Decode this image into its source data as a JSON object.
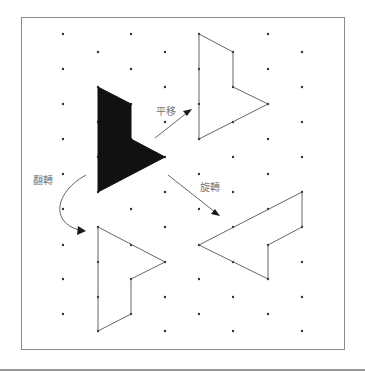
{
  "diagram": {
    "title": "",
    "frame": {
      "x": 21,
      "y": 17,
      "width": 323,
      "height": 332
    },
    "grid": {
      "columns_even_x": [
        63,
        131,
        199,
        268
      ],
      "columns_odd_x": [
        98,
        165,
        233,
        302
      ],
      "rows_even_y": [
        34,
        69,
        104,
        139,
        174,
        209,
        245,
        279,
        314
      ],
      "rows_odd_y": [
        52,
        87,
        122,
        157,
        192,
        227,
        262,
        297,
        331
      ]
    },
    "shapes": [
      {
        "name": "original-shape",
        "filled": true,
        "points": [
          [
            98,
            87
          ],
          [
            131,
            104
          ],
          [
            131,
            139
          ],
          [
            165,
            157
          ],
          [
            98,
            192
          ]
        ]
      },
      {
        "name": "translated-shape",
        "filled": false,
        "points": [
          [
            199,
            34
          ],
          [
            233,
            52
          ],
          [
            233,
            87
          ],
          [
            268,
            104
          ],
          [
            199,
            139
          ]
        ]
      },
      {
        "name": "flipped-shape",
        "filled": false,
        "points": [
          [
            98,
            227
          ],
          [
            165,
            262
          ],
          [
            131,
            279
          ],
          [
            131,
            314
          ],
          [
            98,
            331
          ]
        ]
      },
      {
        "name": "rotated-shape",
        "filled": false,
        "points": [
          [
            302,
            192
          ],
          [
            302,
            227
          ],
          [
            268,
            245
          ],
          [
            268,
            279
          ],
          [
            199,
            245
          ]
        ]
      }
    ],
    "arrows": [
      {
        "name": "translate-arrow",
        "path": "M155,138 L188,112",
        "head": [
          [
            192,
            109
          ],
          [
            183,
            111
          ],
          [
            187,
            116
          ]
        ]
      },
      {
        "name": "rotate-arrow",
        "path": "M168,175 L215,212",
        "head": [
          [
            220,
            216
          ],
          [
            211,
            214
          ],
          [
            215,
            209
          ]
        ]
      },
      {
        "name": "flip-arrow",
        "path": "M86,175 C55,192 50,222 79,230",
        "head": [
          [
            86,
            231
          ],
          [
            78,
            226
          ],
          [
            77,
            235
          ]
        ]
      }
    ],
    "labels": {
      "translate": {
        "text": "平移",
        "x": 156,
        "y": 107
      },
      "flip": {
        "text": "翻轉",
        "x": 33,
        "y": 176
      },
      "rotate": {
        "text": "旋轉",
        "x": 200,
        "y": 183
      }
    },
    "colors": {
      "dot": "#333333",
      "outline": "#555555",
      "fill": "#111111",
      "label": "#777777",
      "frame": "#8a8a8a"
    }
  }
}
